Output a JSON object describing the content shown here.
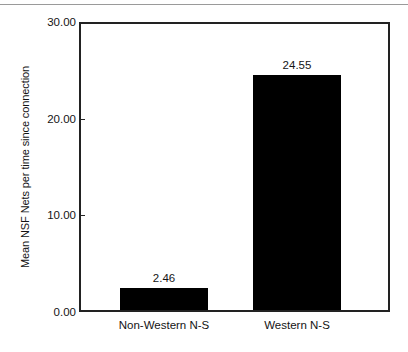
{
  "figure": {
    "top_rule_color": "#9a9a9a",
    "frame_color": "#222222",
    "bar_color": "#000000",
    "background": "#ffffff"
  },
  "chart_data": {
    "type": "bar",
    "title": "",
    "xlabel": "",
    "ylabel": "Mean NSF Nets per time since connection",
    "categories": [
      "Non-Western N-S",
      "Western N-S"
    ],
    "values": [
      2.46,
      24.55
    ],
    "value_labels": [
      "2.46",
      "24.55"
    ],
    "ylim": [
      0,
      30
    ],
    "yticks": [
      0,
      10,
      20,
      30
    ],
    "ytick_labels": [
      "0.00",
      "10.00",
      "20.00",
      "30.00"
    ],
    "grid": false,
    "legend": "none",
    "series": [
      {
        "name": "Mean NSF Nets per time since connection",
        "values": [
          2.46,
          24.55
        ]
      }
    ]
  }
}
